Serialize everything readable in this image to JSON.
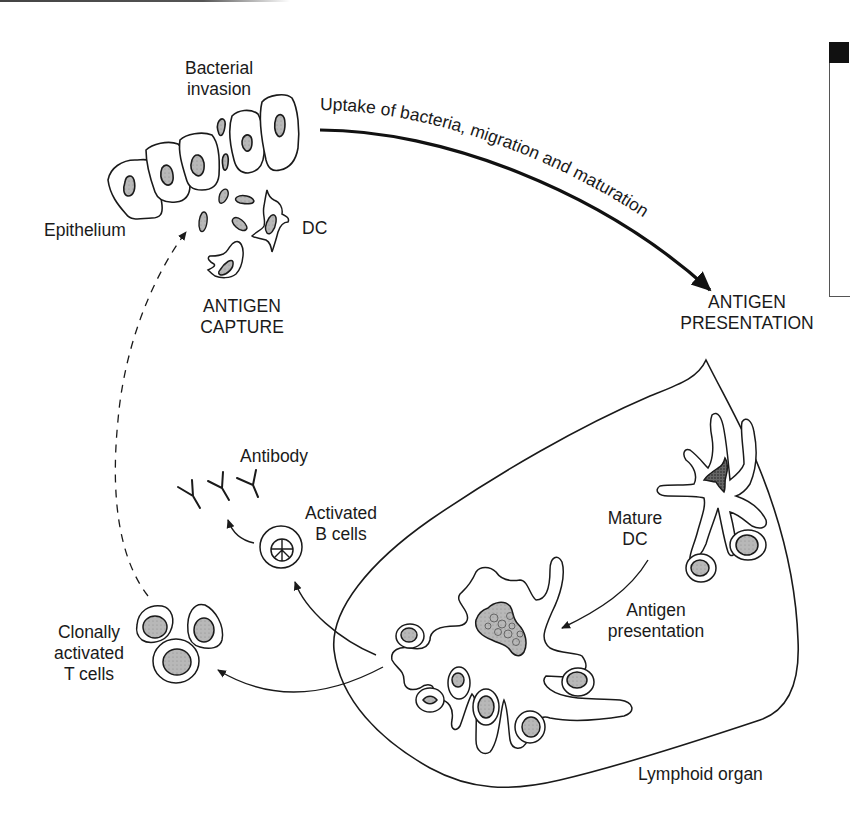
{
  "figure": {
    "labels": {
      "bacterial_invasion": [
        "Bacterial",
        "invasion"
      ],
      "epithelium": "Epithelium",
      "dc": "DC",
      "antigen_capture": [
        "ANTIGEN",
        "CAPTURE"
      ],
      "uptake_arrow": "Uptake of bacteria, migration and maturation",
      "antigen_presentation_title": [
        "ANTIGEN",
        "PRESENTATION"
      ],
      "mature_dc": [
        "Mature",
        "DC"
      ],
      "antigen_presentation": [
        "Antigen",
        "presentation"
      ],
      "lymphoid_organ": "Lymphoid organ",
      "antibody": "Antibody",
      "activated_b_cells": [
        "Activated",
        "B cells"
      ],
      "clonally_activated_t_cells": [
        "Clonally",
        "activated",
        "T cells"
      ]
    },
    "colors": {
      "line": "#1a1a1a",
      "nucleus_fill": "#b8b8b8",
      "dc_nucleus_dark": "#555555",
      "background": "#ffffff"
    }
  }
}
